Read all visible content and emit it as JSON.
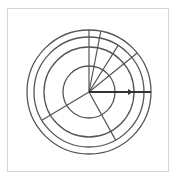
{
  "diagram": {
    "type": "polar-grid",
    "frame": {
      "x": 7,
      "y": 8,
      "width": 162,
      "height": 164,
      "border_color": "#d4d4d4"
    },
    "center": {
      "x": 89,
      "y": 92
    },
    "stroke_color": "#555555",
    "arrow_color": "#333333",
    "rings": [
      {
        "r": 26
      },
      {
        "r": 45
      },
      {
        "r": 55
      },
      {
        "r": 62
      }
    ],
    "radial_lines": [
      {
        "angle_deg": 270,
        "length": 62
      },
      {
        "angle_deg": 281,
        "length": 62
      },
      {
        "angle_deg": 302,
        "length": 55
      },
      {
        "angle_deg": 321,
        "length": 62
      },
      {
        "angle_deg": 61,
        "length": 55
      },
      {
        "angle_deg": 149,
        "length": 55
      }
    ],
    "arrow": {
      "angle_deg": 0,
      "length": 62,
      "head_at": 44
    }
  }
}
